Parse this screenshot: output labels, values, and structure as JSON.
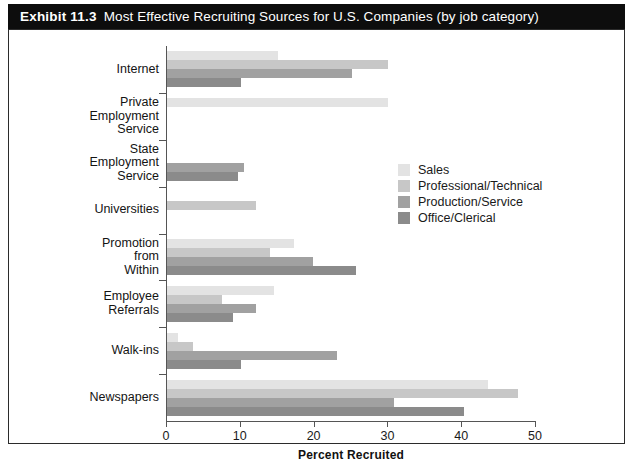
{
  "exhibit": {
    "number": "Exhibit 11.3",
    "title": "Most Effective Recruiting Sources for U.S. Companies (by job category)"
  },
  "chart_data": {
    "type": "bar",
    "orientation": "horizontal",
    "title": "Most Effective Recruiting Sources for U.S. Companies (by job category)",
    "xlabel": "Percent Recruited",
    "ylabel": "",
    "xlim": [
      0,
      50
    ],
    "xticks": [
      0,
      10,
      20,
      30,
      40,
      50
    ],
    "xtick_labels": [
      "0",
      "10",
      "20",
      "30",
      "40",
      "50"
    ],
    "grid": false,
    "legend_position": "center-right",
    "categories": [
      "Internet",
      "Private Employment Service",
      "State Employment Service",
      "Universities",
      "Promotion from Within",
      "Employee Referrals",
      "Walk-ins",
      "Newspapers"
    ],
    "category_label_lines": [
      [
        "Internet"
      ],
      [
        "Private",
        "Employment",
        "Service"
      ],
      [
        "State",
        "Employment",
        "Service"
      ],
      [
        "Universities"
      ],
      [
        "Promotion",
        "from",
        "Within"
      ],
      [
        "Employee",
        "Referrals"
      ],
      [
        "Walk-ins"
      ],
      [
        "Newspapers"
      ]
    ],
    "series": [
      {
        "name": "Sales",
        "color": "#e3e3e3",
        "values": [
          15.0,
          30.0,
          0,
          0,
          17.2,
          14.5,
          1.5,
          43.5
        ]
      },
      {
        "name": "Professional/Technical",
        "color": "#c7c7c7",
        "values": [
          30.0,
          0,
          0,
          12.0,
          14.0,
          7.5,
          3.5,
          47.5
        ]
      },
      {
        "name": "Production/Service",
        "color": "#a1a1a1",
        "values": [
          25.0,
          0,
          10.4,
          0,
          19.8,
          12.0,
          23.0,
          30.8
        ]
      },
      {
        "name": "Office/Clerical",
        "color": "#8b8b8b",
        "values": [
          10.0,
          0,
          9.6,
          0,
          25.6,
          9.0,
          10.0,
          40.2
        ]
      }
    ]
  }
}
